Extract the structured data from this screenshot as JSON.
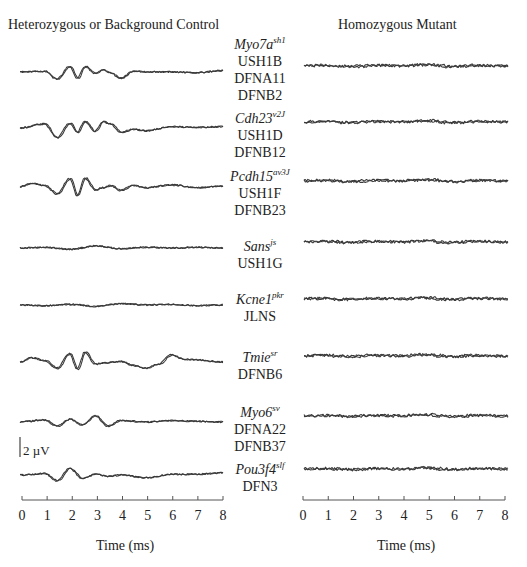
{
  "panels": {
    "left_title": "Heterozygous or Background Control",
    "right_title": "Homozygous Mutant"
  },
  "rows": [
    {
      "gene": "Myo7a",
      "allele": "sh1",
      "diseases": [
        "USH1B",
        "DFNA11",
        "DFNB2"
      ]
    },
    {
      "gene": "Cdh23",
      "allele": "v2J",
      "diseases": [
        "USH1D",
        "DFNB12"
      ]
    },
    {
      "gene": "Pcdh15",
      "allele": "av3J",
      "diseases": [
        "USH1F",
        "DFNB23"
      ]
    },
    {
      "gene": "Sans",
      "allele": "js",
      "diseases": [
        "USH1G"
      ]
    },
    {
      "gene": "Kcne1",
      "allele": "pkr",
      "diseases": [
        "JLNS"
      ]
    },
    {
      "gene": "Tmie",
      "allele": "sr",
      "diseases": [
        "DFNB6"
      ]
    },
    {
      "gene": "Myo6",
      "allele": "sv",
      "diseases": [
        "DFNA22",
        "DFNB37"
      ]
    },
    {
      "gene": "Pou3f4",
      "allele": "slf",
      "diseases": [
        "DFN3"
      ]
    }
  ],
  "axis": {
    "ticks": [
      "0",
      "1",
      "2",
      "3",
      "4",
      "5",
      "6",
      "7",
      "8"
    ],
    "xlabel_left": "Time (ms)",
    "xlabel_right": "Time (ms)"
  },
  "scale_bar": {
    "label": "2 µV"
  },
  "colors": {
    "trace": "#3a3a3a",
    "axis": "#555555"
  },
  "chart_data": {
    "type": "line",
    "xlabel": "Time (ms)",
    "ylabel": "Amplitude (scale bar = 2 µV)",
    "xlim": [
      0,
      8
    ],
    "x_ticks": [
      0,
      1,
      2,
      3,
      4,
      5,
      6,
      7,
      8
    ],
    "grid": false,
    "legend": "none; row labels centered between panels",
    "panels": [
      "Heterozygous or Background Control",
      "Homozygous Mutant"
    ],
    "row_labels": [
      "Myo7a sh1 — USH1B, DFNA11, DFNB2",
      "Cdh23 v2J — USH1D, DFNB12",
      "Pcdh15 av3J — USH1F, DFNB23",
      "Sans js — USH1G",
      "Kcne1 pkr — JLNS",
      "Tmie sr — DFNB6",
      "Myo6 sv — DFNA22, DFNB37",
      "Pou3f4 slf — DFN3"
    ],
    "series": [
      {
        "name": "Control Myo7a",
        "x": [
          0,
          1,
          1.5,
          2,
          2.3,
          2.6,
          3,
          3.3,
          3.6,
          4,
          4.5,
          5,
          6,
          7,
          8
        ],
        "y": [
          0,
          0.1,
          -1.0,
          0.8,
          -0.9,
          0.8,
          -0.2,
          0.3,
          -0.1,
          -0.9,
          0.1,
          0,
          0,
          -0.1,
          0.2
        ]
      },
      {
        "name": "Control Cdh23",
        "x": [
          0,
          1,
          1.5,
          2,
          2.3,
          2.6,
          3,
          3.3,
          3.6,
          4,
          4.5,
          5,
          6,
          7,
          8
        ],
        "y": [
          0,
          0.6,
          -1.4,
          0.7,
          -0.6,
          0.9,
          -0.5,
          0.9,
          0.6,
          -0.6,
          -0.2,
          -0.4,
          0.2,
          0.1,
          0.2
        ]
      },
      {
        "name": "Control Pcdh15",
        "x": [
          0,
          0.5,
          1,
          1.5,
          2,
          2.3,
          2.6,
          3,
          3.3,
          3.6,
          4,
          4.5,
          5,
          6,
          7,
          8
        ],
        "y": [
          0,
          0.5,
          0.2,
          -1.0,
          1.2,
          -1.2,
          1.3,
          -0.4,
          -0.1,
          0.2,
          -0.5,
          0.2,
          -0.1,
          0.3,
          -0.1,
          0.1
        ]
      },
      {
        "name": "Control Sans",
        "x": [
          0,
          1,
          2,
          3,
          4,
          5,
          6,
          7,
          8
        ],
        "y": [
          0,
          0.1,
          -0.2,
          0.3,
          -0.1,
          0.1,
          0,
          0.1,
          0
        ]
      },
      {
        "name": "Control Kcne1",
        "x": [
          0,
          1,
          2,
          3,
          4,
          5,
          6,
          7,
          8
        ],
        "y": [
          0,
          -0.1,
          0.1,
          -0.2,
          0.2,
          0,
          0.1,
          -0.1,
          0
        ]
      },
      {
        "name": "Control Tmie",
        "x": [
          0,
          0.5,
          1,
          1.5,
          2,
          2.3,
          2.6,
          3,
          3.4,
          4,
          4.5,
          5,
          5.5,
          6,
          6.5,
          7,
          8
        ],
        "y": [
          0,
          0.6,
          0.2,
          -0.9,
          1.2,
          -1.0,
          1.4,
          -0.3,
          -0.1,
          0.1,
          -0.5,
          -0.9,
          -0.3,
          1.0,
          0.4,
          0.3,
          0
        ]
      },
      {
        "name": "Control Myo6",
        "x": [
          0,
          1,
          1.5,
          2,
          2.5,
          3,
          3.5,
          4,
          5,
          6,
          7,
          8
        ],
        "y": [
          0,
          0.3,
          -0.6,
          0.4,
          -0.4,
          0.9,
          -0.6,
          0.2,
          0,
          0.2,
          0.1,
          0
        ]
      },
      {
        "name": "Control Pou3f4",
        "x": [
          0,
          1,
          1.5,
          2,
          2.5,
          3,
          3.5,
          4,
          5,
          6,
          7,
          8
        ],
        "y": [
          0,
          0.2,
          -0.8,
          0.9,
          -0.5,
          0.1,
          -0.2,
          0,
          -0.4,
          0.1,
          0.1,
          0.3
        ]
      },
      {
        "name": "Mutant (all genes)",
        "x": [
          0,
          1,
          2,
          3,
          4,
          5,
          6,
          7,
          8
        ],
        "y": [
          0,
          0.1,
          -0.1,
          0.1,
          0,
          0.2,
          -0.1,
          0.1,
          0
        ]
      }
    ]
  }
}
